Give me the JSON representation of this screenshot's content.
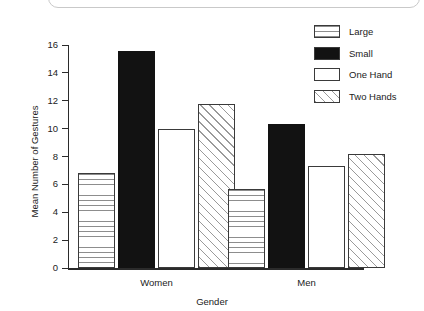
{
  "chart_data": {
    "type": "bar",
    "title": "",
    "xlabel": "Gender",
    "ylabel": "Mean Number of Gestures",
    "categories": [
      "Women",
      "Men"
    ],
    "series": [
      {
        "name": "Large",
        "pattern": "horizontal-lines",
        "values": [
          6.8,
          5.7
        ]
      },
      {
        "name": "Small",
        "pattern": "solid-black",
        "values": [
          15.6,
          10.3
        ]
      },
      {
        "name": "One Hand",
        "pattern": "empty-white",
        "values": [
          10.0,
          7.3
        ]
      },
      {
        "name": "Two Hands",
        "pattern": "diagonal-hatch",
        "values": [
          11.8,
          8.2
        ]
      }
    ],
    "ylim": [
      0,
      16
    ],
    "yticks": [
      0,
      2,
      4,
      6,
      8,
      10,
      12,
      14,
      16
    ],
    "ytick_labels": [
      "0",
      "2",
      "4",
      "6",
      "8",
      "10",
      "12",
      "14",
      "16"
    ],
    "grid": false,
    "legend_position": "top-right",
    "legend_entries": [
      "Large",
      "Small",
      "One Hand",
      "Two Hands"
    ],
    "colors": {
      "axis": "#2b2b2b",
      "bar_outline": "#3a3a3a",
      "solid_fill": "#121212",
      "pattern_line": "#8d8d8d",
      "background": "#ffffff"
    }
  }
}
